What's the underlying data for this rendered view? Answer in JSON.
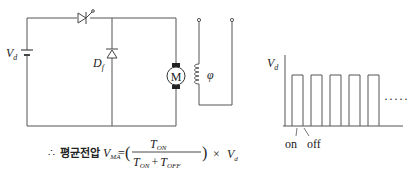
{
  "circuit": {
    "source_label": "V",
    "source_sub": "d",
    "freewheel_diode_label": "D",
    "freewheel_diode_sub": "f",
    "motor_label": "M",
    "field_label": "φ",
    "components": [
      "dc-source",
      "thyristor",
      "freewheeling-diode",
      "dc-motor",
      "field-winding"
    ]
  },
  "formula": {
    "therefore": "∴",
    "korean_label": "평균전압",
    "lhs_var": "V",
    "lhs_sub": "MA",
    "equals": "=",
    "open_paren": "(",
    "numerator_var": "T",
    "numerator_sub": "ON",
    "denominator_var1": "T",
    "denominator_sub1": "ON",
    "plus": "+",
    "denominator_var2": "T",
    "denominator_sub2": "OFF",
    "close_paren": ")",
    "times": "×",
    "rhs_var": "V",
    "rhs_sub": "d"
  },
  "waveform": {
    "y_label": "V",
    "y_sub": "d",
    "on_label": "on",
    "off_label": "off",
    "continuation": "·····",
    "pulse_count": 5
  },
  "colors": {
    "line": "#555555",
    "text": "#222222"
  }
}
